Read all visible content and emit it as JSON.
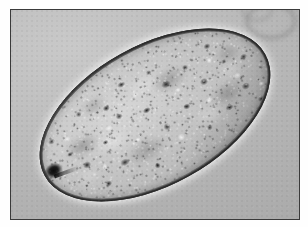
{
  "image": {
    "kind": "photomicrograph",
    "modality": "brightfield light microscopy",
    "color_mode": "grayscale",
    "width_px": 308,
    "height_px": 227,
    "caption": "",
    "background_color": "#b9b9b9",
    "frame": {
      "border_color": "#3a3a3a",
      "border_width_px": 1,
      "page_margin_color": "#fefefe",
      "left_px": 10,
      "top_px": 9,
      "width_px": 290,
      "height_px": 211
    }
  },
  "specimen": {
    "name": "helminth egg",
    "shape": "ellipsoid / ovoid",
    "orientation_degrees": -29,
    "long_axis_px": 252,
    "short_axis_px": 140,
    "shell": {
      "name": "egg shell wall",
      "appearance": "smooth thick refractile wall",
      "color": "#8e8e8e",
      "outline_color": "#1e1e1e"
    },
    "contents": {
      "name": "granular yolk mass",
      "appearance": "densely granular, coarse light and dark granules filling the shell",
      "base_color": "#bdbdbd",
      "dark_granule_color": "#2b2b2b",
      "light_granule_color": "#f2f2f2"
    },
    "polar_feature": {
      "name": "operculum knob",
      "position": "lower-left pole",
      "appearance": "small dense dark knob with a short tapering extension",
      "color": "#0c0c0c"
    },
    "halo": {
      "name": "refraction halo",
      "appearance": "bright rim of refracted light around the shell",
      "color": "#e8e8e8"
    }
  },
  "background_field": {
    "name": "mounting medium field",
    "gradient_light_color": "#c9c9c9",
    "gradient_dark_color": "#a9a9a9",
    "debris": [
      {
        "name": "debris-particle",
        "position": "upper left",
        "x_pct": 14,
        "y_pct": 27,
        "tone": "dark"
      },
      {
        "name": "debris-particle",
        "position": "left of centre",
        "x_pct": 30,
        "y_pct": 43,
        "tone": "dark"
      },
      {
        "name": "debris-particle",
        "position": "lower left",
        "x_pct": 13,
        "y_pct": 83,
        "tone": "dark"
      },
      {
        "name": "debris-particle",
        "position": "lower left corner",
        "x_pct": 5,
        "y_pct": 86,
        "tone": "dark"
      }
    ],
    "out_of_focus_rings": [
      {
        "name": "bubble-ring",
        "position": "top right corner",
        "size": "large"
      },
      {
        "name": "bubble-ring",
        "position": "top right",
        "size": "small"
      }
    ]
  }
}
